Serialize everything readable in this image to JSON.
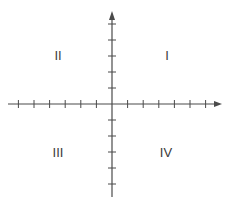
{
  "diagram": {
    "type": "cartesian-coordinate-plane",
    "colors": {
      "axis": "#4a4a4a",
      "label": "#3a3a3a",
      "background": "#ffffff"
    },
    "origin": {
      "x": 112,
      "y": 104
    },
    "x_axis": {
      "from": 8,
      "to": 222,
      "arrow": "right",
      "tick_spacing": 15.6,
      "ticks_negative": 6,
      "ticks_positive": 6
    },
    "y_axis": {
      "from": 197,
      "to": 11,
      "arrow": "up",
      "tick_spacing": 16,
      "ticks_positive": 5,
      "ticks_negative": 5
    },
    "quadrants": [
      {
        "id": "q1",
        "label": "I",
        "x": 167,
        "y": 55
      },
      {
        "id": "q2",
        "label": "II",
        "x": 58,
        "y": 55
      },
      {
        "id": "q3",
        "label": "III",
        "x": 58,
        "y": 152
      },
      {
        "id": "q4",
        "label": "IV",
        "x": 166,
        "y": 152
      }
    ]
  }
}
